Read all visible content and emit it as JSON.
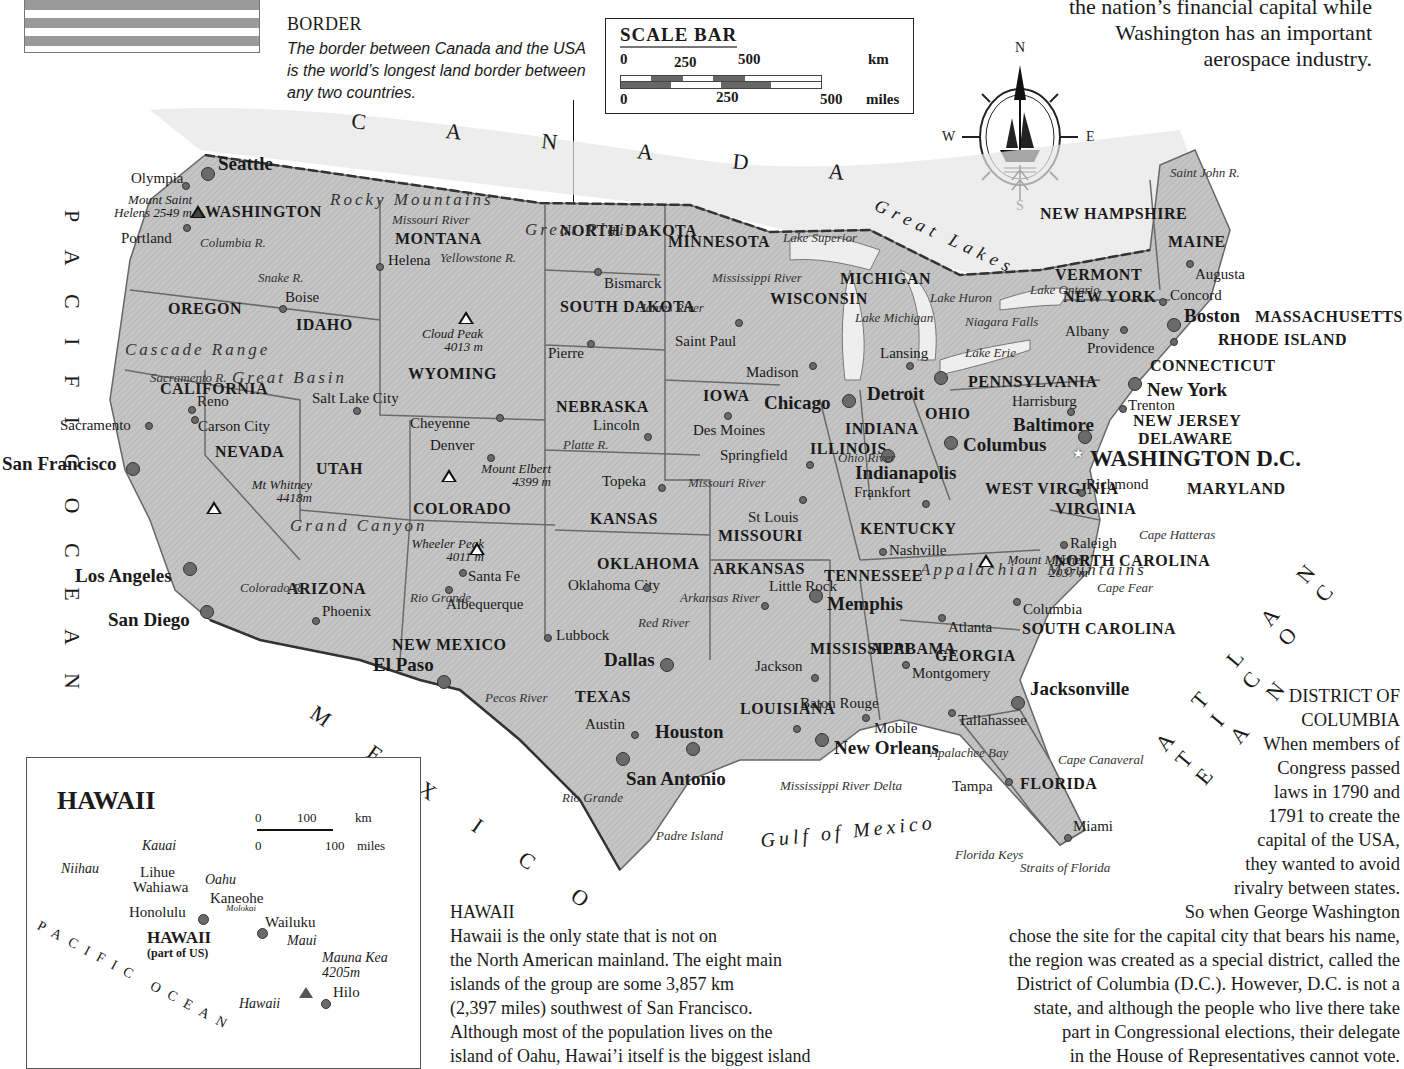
{
  "flag": {
    "name": "us-flag-stripes"
  },
  "border_note": {
    "title": "BORDER",
    "body": "The border between Canada and the USA is the world’s longest land border between any two countries."
  },
  "scale_bar": {
    "title": "SCALE BAR",
    "km_ticks": [
      "0",
      "250",
      "500"
    ],
    "km_unit": "km",
    "mile_ticks": [
      "0",
      "250",
      "500"
    ],
    "mile_unit": "miles"
  },
  "compass": {
    "n": "N",
    "s": "S",
    "e": "E",
    "w": "W"
  },
  "intro_text": {
    "line1": "the nation’s financial capital while",
    "line2": "Washington has an important",
    "line3": "aerospace industry."
  },
  "regions": {
    "canada": "C A N A D A",
    "mexico": "M E X I C O",
    "pacific": "P A C I F I C   O C E A N",
    "atlantic": "A T L A N T I C   O C E A N",
    "gulf": "Gulf of Mexico",
    "great_lakes": "Great Lakes"
  },
  "states": [
    {
      "name": "WASHINGTON",
      "x": 205,
      "y": 203
    },
    {
      "name": "OREGON",
      "x": 168,
      "y": 300
    },
    {
      "name": "IDAHO",
      "x": 296,
      "y": 316
    },
    {
      "name": "MONTANA",
      "x": 395,
      "y": 230
    },
    {
      "name": "WYOMING",
      "x": 408,
      "y": 365
    },
    {
      "name": "NEVADA",
      "x": 215,
      "y": 443
    },
    {
      "name": "UTAH",
      "x": 316,
      "y": 460
    },
    {
      "name": "CALIFORNIA",
      "x": 160,
      "y": 380
    },
    {
      "name": "COLORADO",
      "x": 413,
      "y": 500
    },
    {
      "name": "ARIZONA",
      "x": 287,
      "y": 580
    },
    {
      "name": "NEW MEXICO",
      "x": 392,
      "y": 636
    },
    {
      "name": "NORTH DAKOTA",
      "x": 560,
      "y": 222
    },
    {
      "name": "SOUTH DAKOTA",
      "x": 560,
      "y": 298
    },
    {
      "name": "NEBRASKA",
      "x": 556,
      "y": 398
    },
    {
      "name": "KANSAS",
      "x": 590,
      "y": 510
    },
    {
      "name": "OKLAHOMA",
      "x": 597,
      "y": 555
    },
    {
      "name": "TEXAS",
      "x": 575,
      "y": 688
    },
    {
      "name": "MINNESOTA",
      "x": 668,
      "y": 233
    },
    {
      "name": "IOWA",
      "x": 703,
      "y": 387
    },
    {
      "name": "MISSOURI",
      "x": 718,
      "y": 527
    },
    {
      "name": "ARKANSAS",
      "x": 713,
      "y": 560
    },
    {
      "name": "LOUISIANA",
      "x": 740,
      "y": 700
    },
    {
      "name": "WISCONSIN",
      "x": 770,
      "y": 290
    },
    {
      "name": "ILLINOIS",
      "x": 810,
      "y": 440
    },
    {
      "name": "MICHIGAN",
      "x": 840,
      "y": 270
    },
    {
      "name": "INDIANA",
      "x": 845,
      "y": 420
    },
    {
      "name": "OHIO",
      "x": 925,
      "y": 405
    },
    {
      "name": "KENTUCKY",
      "x": 860,
      "y": 520
    },
    {
      "name": "TENNESSEE",
      "x": 824,
      "y": 567
    },
    {
      "name": "MISSISSIPPI",
      "x": 810,
      "y": 640
    },
    {
      "name": "ALABAMA",
      "x": 870,
      "y": 640
    },
    {
      "name": "GEORGIA",
      "x": 935,
      "y": 647
    },
    {
      "name": "FLORIDA",
      "x": 1020,
      "y": 775
    },
    {
      "name": "SOUTH CAROLINA",
      "x": 1022,
      "y": 620
    },
    {
      "name": "NORTH CAROLINA",
      "x": 1054,
      "y": 552
    },
    {
      "name": "VIRGINIA",
      "x": 1055,
      "y": 500
    },
    {
      "name": "WEST VIRGINIA",
      "x": 985,
      "y": 480
    },
    {
      "name": "PENNSYLVANIA",
      "x": 968,
      "y": 373
    },
    {
      "name": "NEW YORK",
      "x": 1063,
      "y": 288
    },
    {
      "name": "VERMONT",
      "x": 1055,
      "y": 266
    },
    {
      "name": "NEW HAMPSHIRE",
      "x": 1040,
      "y": 205
    },
    {
      "name": "MAINE",
      "x": 1168,
      "y": 233
    },
    {
      "name": "MASSACHUSETTS",
      "x": 1255,
      "y": 308
    },
    {
      "name": "RHODE ISLAND",
      "x": 1218,
      "y": 331
    },
    {
      "name": "CONNECTICUT",
      "x": 1150,
      "y": 357
    },
    {
      "name": "NEW JERSEY",
      "x": 1133,
      "y": 412
    },
    {
      "name": "DELAWARE",
      "x": 1138,
      "y": 430
    },
    {
      "name": "MARYLAND",
      "x": 1187,
      "y": 480
    }
  ],
  "capital": {
    "name": "WASHINGTON D.C.",
    "x": 1090,
    "y": 448
  },
  "big_cities": [
    {
      "name": "Seattle",
      "x": 218,
      "y": 153,
      "dx": 208,
      "dy": 174
    },
    {
      "name": "San Francisco",
      "x": 2,
      "y": 453,
      "dx": 133,
      "dy": 469
    },
    {
      "name": "Los Angeles",
      "x": 75,
      "y": 565,
      "dx": 190,
      "dy": 569
    },
    {
      "name": "San Diego",
      "x": 108,
      "y": 609,
      "dx": 207,
      "dy": 612
    },
    {
      "name": "El Paso",
      "x": 373,
      "y": 654,
      "dx": 444,
      "dy": 682
    },
    {
      "name": "Dallas",
      "x": 604,
      "y": 649,
      "dx": 667,
      "dy": 665
    },
    {
      "name": "Houston",
      "x": 655,
      "y": 721,
      "dx": 693,
      "dy": 749
    },
    {
      "name": "San Antonio",
      "x": 626,
      "y": 768,
      "dx": 623,
      "dy": 759
    },
    {
      "name": "Chicago",
      "x": 764,
      "y": 392,
      "dx": 849,
      "dy": 401
    },
    {
      "name": "Detroit",
      "x": 867,
      "y": 383,
      "dx": 941,
      "dy": 378
    },
    {
      "name": "Indianapolis",
      "x": 855,
      "y": 462,
      "dx": 888,
      "dy": 456
    },
    {
      "name": "Columbus",
      "x": 963,
      "y": 434,
      "dx": 951,
      "dy": 443
    },
    {
      "name": "Baltimore",
      "x": 1013,
      "y": 414,
      "dx": 1085,
      "dy": 437
    },
    {
      "name": "New York",
      "x": 1147,
      "y": 379,
      "dx": 1135,
      "dy": 384
    },
    {
      "name": "Boston",
      "x": 1184,
      "y": 305,
      "dx": 1174,
      "dy": 325
    },
    {
      "name": "Memphis",
      "x": 827,
      "y": 593,
      "dx": 816,
      "dy": 596
    },
    {
      "name": "New Orleans",
      "x": 834,
      "y": 737,
      "dx": 822,
      "dy": 740
    },
    {
      "name": "Jacksonville",
      "x": 1030,
      "y": 678,
      "dx": 1018,
      "dy": 703
    }
  ],
  "cities": [
    {
      "name": "Olympia",
      "x": 131,
      "y": 170,
      "dx": 186,
      "dy": 186
    },
    {
      "name": "Portland",
      "x": 121,
      "y": 230,
      "dx": 187,
      "dy": 228
    },
    {
      "name": "Helena",
      "x": 388,
      "y": 252,
      "dx": 380,
      "dy": 267
    },
    {
      "name": "Boise",
      "x": 285,
      "y": 289,
      "dx": 283,
      "dy": 309
    },
    {
      "name": "Sacramento",
      "x": 60,
      "y": 417,
      "dx": 149,
      "dy": 426
    },
    {
      "name": "Reno",
      "x": 197,
      "y": 393,
      "dx": 192,
      "dy": 410
    },
    {
      "name": "Carson City",
      "x": 198,
      "y": 418,
      "dx": 195,
      "dy": 420
    },
    {
      "name": "Salt Lake City",
      "x": 312,
      "y": 390,
      "dx": 357,
      "dy": 411
    },
    {
      "name": "Cheyenne",
      "x": 410,
      "y": 415,
      "dx": 500,
      "dy": 418
    },
    {
      "name": "Denver",
      "x": 430,
      "y": 437,
      "dx": 491,
      "dy": 458
    },
    {
      "name": "Phoenix",
      "x": 322,
      "y": 603,
      "dx": 316,
      "dy": 621
    },
    {
      "name": "Santa Fe",
      "x": 468,
      "y": 568,
      "dx": 463,
      "dy": 573
    },
    {
      "name": "Albequerque",
      "x": 446,
      "y": 596,
      "dx": 449,
      "dy": 590
    },
    {
      "name": "Bismarck",
      "x": 604,
      "y": 275,
      "dx": 598,
      "dy": 272
    },
    {
      "name": "Pierre",
      "x": 548,
      "y": 345,
      "dx": 591,
      "dy": 344
    },
    {
      "name": "Saint Paul",
      "x": 675,
      "y": 333,
      "dx": 739,
      "dy": 323
    },
    {
      "name": "Madison",
      "x": 746,
      "y": 364,
      "dx": 813,
      "dy": 366
    },
    {
      "name": "Lincoln",
      "x": 593,
      "y": 417,
      "dx": 648,
      "dy": 437
    },
    {
      "name": "Des Moines",
      "x": 693,
      "y": 422,
      "dx": 728,
      "dy": 416
    },
    {
      "name": "Springfield",
      "x": 720,
      "y": 447,
      "dx": 810,
      "dy": 465
    },
    {
      "name": "Topeka",
      "x": 602,
      "y": 473,
      "dx": 662,
      "dy": 488
    },
    {
      "name": "St Louis",
      "x": 748,
      "y": 509,
      "dx": 803,
      "dy": 500
    },
    {
      "name": "Frankfort",
      "x": 854,
      "y": 484,
      "dx": 926,
      "dy": 504
    },
    {
      "name": "Lansing",
      "x": 880,
      "y": 345,
      "dx": 910,
      "dy": 366
    },
    {
      "name": "Harrisburg",
      "x": 1012,
      "y": 393,
      "dx": 1071,
      "dy": 412
    },
    {
      "name": "Trenton",
      "x": 1128,
      "y": 397,
      "dx": 1123,
      "dy": 409
    },
    {
      "name": "Albany",
      "x": 1065,
      "y": 323,
      "dx": 1124,
      "dy": 330
    },
    {
      "name": "Providence",
      "x": 1087,
      "y": 340,
      "dx": 1174,
      "dy": 342
    },
    {
      "name": "Concord",
      "x": 1170,
      "y": 287,
      "dx": 1163,
      "dy": 302
    },
    {
      "name": "Augusta",
      "x": 1195,
      "y": 266,
      "dx": 1190,
      "dy": 264
    },
    {
      "name": "Richmond",
      "x": 1086,
      "y": 476,
      "dx": 1082,
      "dy": 493
    },
    {
      "name": "Raleigh",
      "x": 1070,
      "y": 535,
      "dx": 1064,
      "dy": 545
    },
    {
      "name": "Nashville",
      "x": 889,
      "y": 542,
      "dx": 883,
      "dy": 552
    },
    {
      "name": "Columbia",
      "x": 1023,
      "y": 601,
      "dx": 1017,
      "dy": 602
    },
    {
      "name": "Atlanta",
      "x": 948,
      "y": 619,
      "dx": 942,
      "dy": 618
    },
    {
      "name": "Oklahoma City",
      "x": 568,
      "y": 577,
      "dx": 647,
      "dy": 588
    },
    {
      "name": "Little Rock",
      "x": 769,
      "y": 578,
      "dx": 765,
      "dy": 606
    },
    {
      "name": "Lubbock",
      "x": 556,
      "y": 627,
      "dx": 548,
      "dy": 638
    },
    {
      "name": "Jackson",
      "x": 755,
      "y": 658,
      "dx": 815,
      "dy": 678
    },
    {
      "name": "Montgomery",
      "x": 912,
      "y": 665,
      "dx": 906,
      "dy": 665
    },
    {
      "name": "Baton Rouge",
      "x": 800,
      "y": 695,
      "dx": 797,
      "dy": 729
    },
    {
      "name": "Mobile",
      "x": 874,
      "y": 720,
      "dx": 866,
      "dy": 718
    },
    {
      "name": "Austin",
      "x": 585,
      "y": 716,
      "dx": 635,
      "dy": 735
    },
    {
      "name": "Tallahassee",
      "x": 958,
      "y": 712,
      "dx": 952,
      "dy": 713
    },
    {
      "name": "Tampa",
      "x": 952,
      "y": 778,
      "dx": 1009,
      "dy": 782
    },
    {
      "name": "Miami",
      "x": 1073,
      "y": 818,
      "dx": 1068,
      "dy": 838
    }
  ],
  "peaks": [
    {
      "name": "Mount Saint Helens 2549 m",
      "x": 102,
      "y": 193,
      "tx": 198,
      "ty": 212,
      "filled": true
    },
    {
      "name": "Cloud Peak 4013 m",
      "x": 393,
      "y": 327,
      "tx": 466,
      "ty": 318,
      "filled": false
    },
    {
      "name": "Mt Whitney 4418m",
      "x": 222,
      "y": 478,
      "tx": 214,
      "ty": 508,
      "filled": false
    },
    {
      "name": "Mount Elbert 4399 m",
      "x": 461,
      "y": 462,
      "tx": 449,
      "ty": 476,
      "filled": false
    },
    {
      "name": "Wheeler Peak 4011 m",
      "x": 394,
      "y": 537,
      "tx": 477,
      "ty": 549,
      "filled": false
    },
    {
      "name": "Mount Mitchell 2037 m",
      "x": 998,
      "y": 553,
      "tx": 986,
      "ty": 561,
      "filled": false
    }
  ],
  "water_labels": [
    {
      "name": "Columbia R.",
      "x": 200,
      "y": 235
    },
    {
      "name": "Snake R.",
      "x": 258,
      "y": 270
    },
    {
      "name": "Missouri River",
      "x": 392,
      "y": 212
    },
    {
      "name": "Yellowstone R.",
      "x": 440,
      "y": 250
    },
    {
      "name": "James River",
      "x": 640,
      "y": 300
    },
    {
      "name": "Platte R.",
      "x": 563,
      "y": 437
    },
    {
      "name": "Missouri River",
      "x": 688,
      "y": 475
    },
    {
      "name": "Mississippi River",
      "x": 712,
      "y": 270
    },
    {
      "name": "Lake Superior",
      "x": 783,
      "y": 230
    },
    {
      "name": "Lake Michigan",
      "x": 855,
      "y": 310
    },
    {
      "name": "Lake Huron",
      "x": 930,
      "y": 290
    },
    {
      "name": "Lake Ontario",
      "x": 1030,
      "y": 282
    },
    {
      "name": "Niagara Falls",
      "x": 965,
      "y": 314
    },
    {
      "name": "Lake Erie",
      "x": 965,
      "y": 345
    },
    {
      "name": "Ohio River",
      "x": 838,
      "y": 450
    },
    {
      "name": "Arkansas River",
      "x": 680,
      "y": 590
    },
    {
      "name": "Red River",
      "x": 638,
      "y": 615
    },
    {
      "name": "Rio Grande",
      "x": 410,
      "y": 590
    },
    {
      "name": "Pecos River",
      "x": 485,
      "y": 690
    },
    {
      "name": "Rio Grande",
      "x": 562,
      "y": 790
    },
    {
      "name": "Colorado R.",
      "x": 240,
      "y": 580
    },
    {
      "name": "Sacramento R.",
      "x": 150,
      "y": 370
    },
    {
      "name": "Saint John R.",
      "x": 1170,
      "y": 165
    },
    {
      "name": "Padre Island",
      "x": 656,
      "y": 828
    },
    {
      "name": "Mississippi River Delta",
      "x": 780,
      "y": 778
    },
    {
      "name": "Apalachee Bay",
      "x": 930,
      "y": 745
    },
    {
      "name": "Cape Canaveral",
      "x": 1058,
      "y": 752
    },
    {
      "name": "Cape Hatteras",
      "x": 1139,
      "y": 527
    },
    {
      "name": "Cape Fear",
      "x": 1097,
      "y": 580
    },
    {
      "name": "Florida Keys",
      "x": 955,
      "y": 847
    },
    {
      "name": "Straits of Florida",
      "x": 1020,
      "y": 860
    }
  ],
  "terrain_labels": [
    {
      "name": "Cascade Range",
      "x": 125,
      "y": 340
    },
    {
      "name": "Rocky Mountains",
      "x": 330,
      "y": 190
    },
    {
      "name": "Great Basin",
      "x": 232,
      "y": 368
    },
    {
      "name": "Great Plains",
      "x": 525,
      "y": 220
    },
    {
      "name": "Grand Canyon",
      "x": 290,
      "y": 516
    },
    {
      "name": "Appalachian Mountains",
      "x": 920,
      "y": 560
    }
  ],
  "hawaii_inset": {
    "title": "HAWAII",
    "scale": {
      "km_ticks": [
        "0",
        "100"
      ],
      "km_unit": "km",
      "mile_ticks": [
        "0",
        "100"
      ],
      "mile_unit": "miles"
    },
    "islands": [
      "Kauai",
      "Niihau",
      "Oahu",
      "Molokai",
      "Maui",
      "Hawaii"
    ],
    "cities": [
      "Lihue",
      "Wahiawa",
      "Kaneohe",
      "Honolulu",
      "Wailuku",
      "Hilo"
    ],
    "peak": "Mauna Kea 4205m",
    "state_label": "HAWAII",
    "state_sub": "(part of US)",
    "ocean": "PACIFIC OCEAN"
  },
  "hawaii_text": {
    "title": "HAWAII",
    "lines": [
      "Hawaii is the only state that is not on",
      "the North American mainland. The eight main",
      "islands of the group are some 3,857 km",
      "(2,397 miles) southwest of San Francisco.",
      "Although most of the population lives on the",
      "island of Oahu, Hawai’i itself is the biggest island"
    ]
  },
  "dc_text": {
    "title1": "DISTRICT OF",
    "title2": "COLUMBIA",
    "lines": [
      "When members of",
      "Congress passed",
      "laws in 1790 and",
      "1791 to create the",
      "capital of the USA,",
      "they wanted to avoid",
      "rivalry between states.",
      "So when George Washington",
      "chose the site for the capital city that bears his name,",
      "the region was created as a special district, called the",
      "District of Columbia (D.C.). However, D.C. is not a",
      "state, and although the people who live there take",
      "part in Congressional elections, their delegate",
      "in the House of Representatives cannot vote."
    ]
  },
  "colors": {
    "land": "#c9c9c9",
    "land_dark": "#a9a9a9",
    "border": "#555555",
    "dot": "#6a6a6a",
    "ink": "#1a1a1a"
  }
}
